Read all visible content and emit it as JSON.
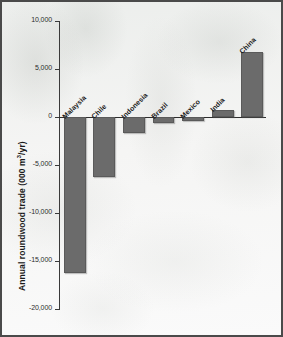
{
  "figure": {
    "background_color": "#f3f3f2",
    "border_color": "#4a4a4a",
    "bar_color": "#6b6b6b",
    "axis_color": "#3a3a3a"
  },
  "chart_data": {
    "type": "bar",
    "title": "",
    "subtitle": "",
    "xlabel": "",
    "ylabel_prefix": "Annual roundwood trade (000 m",
    "ylabel_sup": "3",
    "ylabel_suffix": "/yr)",
    "ylabel": "Annual roundwood trade (000 m3/yr)",
    "categories": [
      "Malaysia",
      "Chile",
      "Indonesia",
      "Brazil",
      "Mexico",
      "India",
      "China"
    ],
    "values": [
      -16300,
      -6250,
      -1700,
      -600,
      -450,
      700,
      6800
    ],
    "ylim": [
      -20000,
      10000
    ],
    "yticks": [
      10000,
      5000,
      0,
      -5000,
      -10000,
      -15000,
      -20000
    ],
    "ytick_labels": [
      "10,000",
      "5,000",
      "0",
      "-5,000",
      "-10,000",
      "-15,000",
      "-20,000"
    ],
    "grid": false,
    "legend": false,
    "legend_position": "none",
    "orientation": "vertical",
    "tick_label_rotation": -45
  }
}
